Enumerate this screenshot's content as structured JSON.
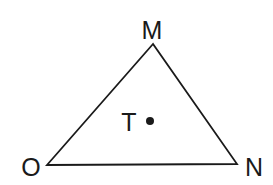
{
  "diagram": {
    "type": "triangle-with-interior-point",
    "stroke_color": "#1a1a1a",
    "background": "#ffffff",
    "vertices": [
      {
        "name": "M",
        "x": 153,
        "y": 44,
        "label_x": 152,
        "label_y": 39
      },
      {
        "name": "O",
        "x": 47,
        "y": 165,
        "label_x": 31,
        "label_y": 176
      },
      {
        "name": "N",
        "x": 237,
        "y": 164,
        "label_x": 254,
        "label_y": 176
      }
    ],
    "point": {
      "name": "T",
      "x": 150,
      "y": 121,
      "label_x": 129,
      "label_y": 131
    }
  }
}
